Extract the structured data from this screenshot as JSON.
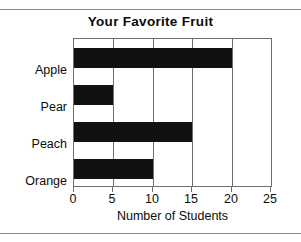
{
  "chart_data": {
    "type": "bar",
    "orientation": "horizontal",
    "title": "Your Favorite Fruit",
    "xlabel": "Number of Students",
    "ylabel": "",
    "categories": [
      "Apple",
      "Pear",
      "Peach",
      "Orange"
    ],
    "values": [
      20,
      5,
      15,
      10
    ],
    "xlim": [
      0,
      25
    ],
    "xticks": [
      0,
      5,
      10,
      15,
      20,
      25
    ],
    "xticklabels": [
      "0",
      "5",
      "10",
      "15",
      "20",
      "25"
    ],
    "grid": "vertical",
    "legend": "none",
    "bar_color": "#111111",
    "frame_color": "#6f6f6f"
  }
}
